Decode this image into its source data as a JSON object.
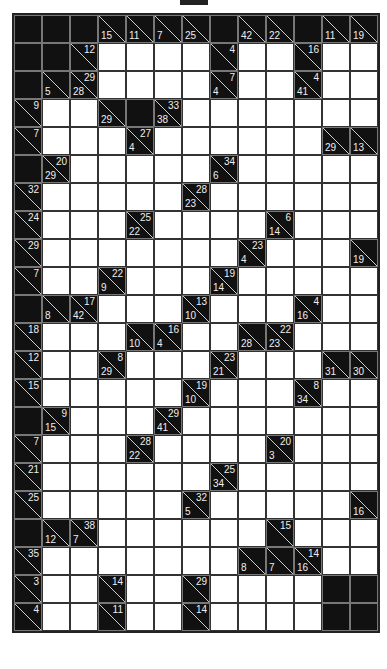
{
  "puzzle": {
    "type": "kakuro",
    "cols": 13,
    "rows": 22,
    "legend": "Each cell: W = white entry cell, B = black, or clue object {d: down-sum, r: across-sum}",
    "grid": [
      [
        "B",
        "B",
        "B",
        {
          "d": "15"
        },
        {
          "d": "11"
        },
        {
          "d": "7"
        },
        {
          "d": "25"
        },
        "B",
        {
          "d": "42"
        },
        {
          "d": "22"
        },
        "B",
        {
          "d": "11"
        },
        {
          "d": "19"
        }
      ],
      [
        "B",
        "B",
        {
          "r": "12"
        },
        "W",
        "W",
        "W",
        "W",
        {
          "r": "4"
        },
        "W",
        "W",
        {
          "r": "16"
        },
        "W",
        "W"
      ],
      [
        "B",
        {
          "d": "5"
        },
        {
          "d": "28",
          "r": "29"
        },
        "W",
        "W",
        "W",
        "W",
        {
          "d": "4",
          "r": "7"
        },
        "W",
        "W",
        {
          "d": "41",
          "r": "4"
        },
        "W",
        "W"
      ],
      [
        {
          "r": "9"
        },
        "W",
        "W",
        {
          "d": "29"
        },
        "B",
        {
          "d": "38",
          "r": "33"
        },
        "W",
        "W",
        "W",
        "W",
        "W",
        "W",
        "W"
      ],
      [
        {
          "r": "7"
        },
        "W",
        "W",
        "W",
        {
          "d": "4",
          "r": "27"
        },
        "W",
        "W",
        "W",
        "W",
        "W",
        "W",
        {
          "d": "29"
        },
        {
          "d": "13"
        }
      ],
      [
        "B",
        {
          "d": "29",
          "r": "20"
        },
        "W",
        "W",
        "W",
        "W",
        "W",
        {
          "d": "6",
          "r": "34"
        },
        "W",
        "W",
        "W",
        "W",
        "W"
      ],
      [
        {
          "r": "32"
        },
        "W",
        "W",
        "W",
        "W",
        "W",
        {
          "d": "23",
          "r": "28"
        },
        "W",
        "W",
        "W",
        "W",
        "W",
        "W"
      ],
      [
        {
          "r": "24"
        },
        "W",
        "W",
        "W",
        {
          "d": "22",
          "r": "25"
        },
        "W",
        "W",
        "W",
        "W",
        {
          "d": "14",
          "r": "6"
        },
        "W",
        "W",
        "W"
      ],
      [
        {
          "r": "29"
        },
        "W",
        "W",
        "W",
        "W",
        "W",
        "W",
        "W",
        {
          "d": "4",
          "r": "23"
        },
        "W",
        "W",
        "W",
        {
          "d": "19"
        }
      ],
      [
        {
          "r": "7"
        },
        "W",
        "W",
        {
          "d": "9",
          "r": "22"
        },
        "W",
        "W",
        "W",
        {
          "d": "14",
          "r": "19"
        },
        "W",
        "W",
        "W",
        "W",
        "W"
      ],
      [
        "B",
        {
          "d": "8"
        },
        {
          "d": "42",
          "r": "17"
        },
        "W",
        "W",
        "W",
        {
          "d": "10",
          "r": "13"
        },
        "W",
        "W",
        "W",
        {
          "d": "16",
          "r": "4"
        },
        "W",
        "W"
      ],
      [
        {
          "r": "18"
        },
        "W",
        "W",
        "W",
        {
          "d": "10"
        },
        {
          "d": "4",
          "r": "16"
        },
        "W",
        "W",
        {
          "d": "28"
        },
        {
          "d": "23",
          "r": "22"
        },
        "W",
        "W",
        "W"
      ],
      [
        {
          "r": "12"
        },
        "W",
        "W",
        {
          "d": "29",
          "r": "8"
        },
        "W",
        "W",
        "W",
        {
          "d": "21",
          "r": "23"
        },
        "W",
        "W",
        "W",
        {
          "d": "31"
        },
        {
          "d": "30"
        }
      ],
      [
        {
          "r": "15"
        },
        "W",
        "W",
        "W",
        "W",
        "W",
        {
          "d": "10",
          "r": "19"
        },
        "W",
        "W",
        "W",
        {
          "d": "34",
          "r": "8"
        },
        "W",
        "W"
      ],
      [
        "B",
        {
          "d": "15",
          "r": "9"
        },
        "W",
        "W",
        "W",
        {
          "d": "41",
          "r": "29"
        },
        "W",
        "W",
        "W",
        "W",
        "W",
        "W",
        "W"
      ],
      [
        {
          "r": "7"
        },
        "W",
        "W",
        "W",
        {
          "d": "22",
          "r": "28"
        },
        "W",
        "W",
        "W",
        "W",
        {
          "d": "3",
          "r": "20"
        },
        "W",
        "W",
        "W"
      ],
      [
        {
          "r": "21"
        },
        "W",
        "W",
        "W",
        "W",
        "W",
        "W",
        {
          "d": "34",
          "r": "25"
        },
        "W",
        "W",
        "W",
        "W",
        "W"
      ],
      [
        {
          "r": "25"
        },
        "W",
        "W",
        "W",
        "W",
        "W",
        {
          "d": "5",
          "r": "32"
        },
        "W",
        "W",
        "W",
        "W",
        "W",
        {
          "d": "16"
        }
      ],
      [
        "B",
        {
          "d": "12"
        },
        {
          "d": "7",
          "r": "38"
        },
        "W",
        "W",
        "W",
        "W",
        "W",
        "W",
        {
          "r": "15"
        },
        "W",
        "W",
        "W"
      ],
      [
        {
          "r": "35"
        },
        "W",
        "W",
        "W",
        "W",
        "W",
        "W",
        "W",
        {
          "d": "8"
        },
        {
          "d": "7"
        },
        {
          "d": "16",
          "r": "14"
        },
        "W",
        "W"
      ],
      [
        {
          "r": "3"
        },
        "W",
        "W",
        {
          "r": "14"
        },
        "W",
        "W",
        {
          "r": "29"
        },
        "W",
        "W",
        "W",
        "W",
        "B",
        "B"
      ],
      [
        {
          "r": "4"
        },
        "W",
        "W",
        {
          "r": "11"
        },
        "W",
        "W",
        {
          "r": "14"
        },
        "W",
        "W",
        "W",
        "W",
        "B",
        "B"
      ]
    ]
  },
  "colors": {
    "black": "#111111",
    "white": "#ffffff",
    "clue_text": "#eeeeee",
    "grid_line": "#333333"
  }
}
